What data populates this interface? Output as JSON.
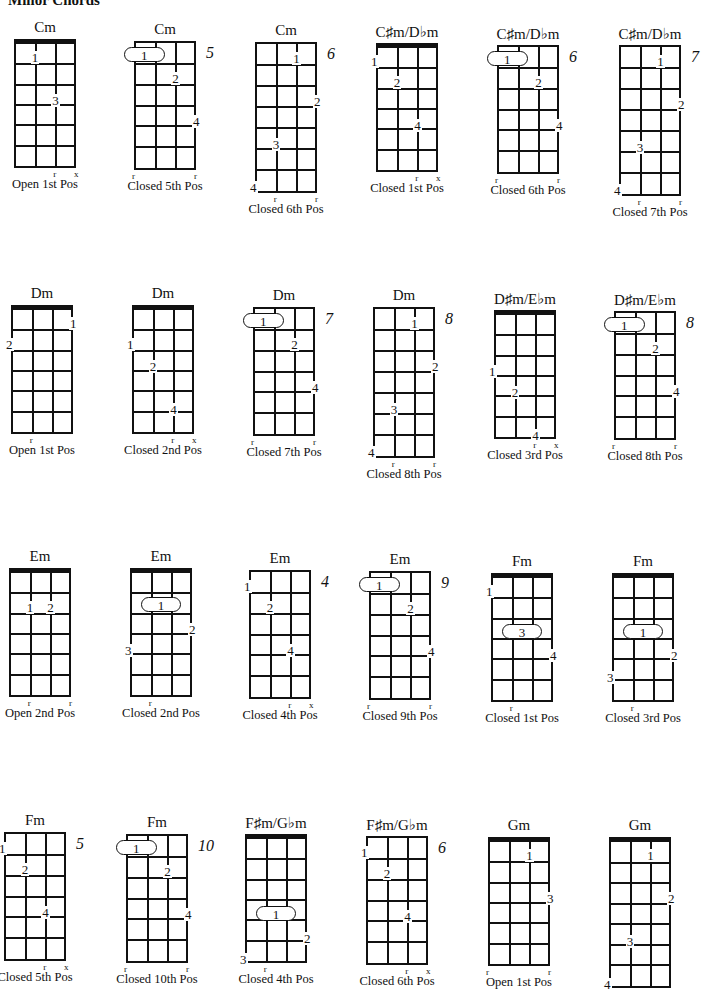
{
  "page": {
    "title": "Minor Chords"
  },
  "chords": [
    {
      "name": "Cm",
      "caption": "Open 1st Pos",
      "x": 14,
      "y": 39,
      "frets": 6,
      "nut": true,
      "pos": "",
      "fingers": [
        {
          "s": 1,
          "f": 1,
          "n": "1"
        },
        {
          "s": 2,
          "f": 3,
          "n": "3"
        }
      ],
      "barre": null,
      "bottom": [
        {
          "s": 2,
          "m": "r"
        },
        {
          "s": 3,
          "m": "x"
        }
      ]
    },
    {
      "name": "Cm",
      "caption": "Closed 5th Pos",
      "x": 134,
      "y": 41,
      "frets": 6,
      "nut": false,
      "pos": "5",
      "fingers": [
        {
          "s": 2,
          "f": 2,
          "n": "2"
        },
        {
          "s": 3,
          "f": 4,
          "n": "4"
        }
      ],
      "barre": {
        "from": 0,
        "to": 1,
        "f": 1,
        "n": "1"
      },
      "bottom": [
        {
          "s": 0,
          "m": "r"
        },
        {
          "s": 3,
          "m": "r"
        }
      ]
    },
    {
      "name": "Cm",
      "caption": "Closed 6th Pos",
      "x": 255,
      "y": 42,
      "frets": 7,
      "nut": false,
      "pos": "6",
      "fingers": [
        {
          "s": 2,
          "f": 1,
          "n": "1"
        },
        {
          "s": 3,
          "f": 3,
          "n": "2"
        },
        {
          "s": 1,
          "f": 5,
          "n": "3"
        },
        {
          "s": 0,
          "f": 7,
          "n": "4"
        }
      ],
      "barre": null,
      "bottom": [
        {
          "s": 1,
          "m": "r"
        },
        {
          "s": 3,
          "m": "r"
        }
      ]
    },
    {
      "name": "C♯m/D♭m",
      "caption": "Closed 1st Pos",
      "x": 376,
      "y": 43,
      "frets": 6,
      "nut": true,
      "pos": "",
      "fingers": [
        {
          "s": 0,
          "f": 1,
          "n": "1"
        },
        {
          "s": 1,
          "f": 2,
          "n": "2"
        },
        {
          "s": 2,
          "f": 4,
          "n": "4"
        }
      ],
      "barre": null,
      "bottom": [
        {
          "s": 2,
          "m": "r"
        },
        {
          "s": 3,
          "m": "x"
        }
      ]
    },
    {
      "name": "C♯m/D♭m",
      "caption": "Closed 6th Pos",
      "x": 497,
      "y": 45,
      "frets": 6,
      "nut": false,
      "pos": "6",
      "fingers": [
        {
          "s": 2,
          "f": 2,
          "n": "2"
        },
        {
          "s": 3,
          "f": 4,
          "n": "4"
        }
      ],
      "barre": {
        "from": 0,
        "to": 1,
        "f": 1,
        "n": "1"
      },
      "bottom": [
        {
          "s": 0,
          "m": "r"
        },
        {
          "s": 3,
          "m": "r"
        }
      ]
    },
    {
      "name": "C♯m/D♭m",
      "caption": "Closed 7th Pos",
      "x": 619,
      "y": 45,
      "frets": 7,
      "nut": false,
      "pos": "7",
      "fingers": [
        {
          "s": 2,
          "f": 1,
          "n": "1"
        },
        {
          "s": 3,
          "f": 3,
          "n": "2"
        },
        {
          "s": 1,
          "f": 5,
          "n": "3"
        },
        {
          "s": 0,
          "f": 7,
          "n": "4"
        }
      ],
      "barre": null,
      "bottom": [
        {
          "s": 1,
          "m": "r"
        },
        {
          "s": 3,
          "m": "r"
        }
      ]
    },
    {
      "name": "Dm",
      "caption": "Open 1st Pos",
      "x": 11,
      "y": 305,
      "frets": 6,
      "nut": true,
      "pos": "",
      "fingers": [
        {
          "s": 3,
          "f": 1,
          "n": "1"
        },
        {
          "s": 0,
          "f": 2,
          "n": "2"
        }
      ],
      "barre": null,
      "bottom": [
        {
          "s": 1,
          "m": "r"
        }
      ]
    },
    {
      "name": "Dm",
      "caption": "Closed 2nd Pos",
      "x": 132,
      "y": 305,
      "frets": 6,
      "nut": true,
      "pos": "",
      "fingers": [
        {
          "s": 0,
          "f": 2,
          "n": "1"
        },
        {
          "s": 1,
          "f": 3,
          "n": "2"
        },
        {
          "s": 2,
          "f": 5,
          "n": "4"
        }
      ],
      "barre": null,
      "bottom": [
        {
          "s": 2,
          "m": "r"
        },
        {
          "s": 3,
          "m": "x"
        }
      ]
    },
    {
      "name": "Dm",
      "caption": "Closed 7th Pos",
      "x": 253,
      "y": 307,
      "frets": 6,
      "nut": false,
      "pos": "7",
      "fingers": [
        {
          "s": 2,
          "f": 2,
          "n": "2"
        },
        {
          "s": 3,
          "f": 4,
          "n": "4"
        }
      ],
      "barre": {
        "from": 0,
        "to": 1,
        "f": 1,
        "n": "1"
      },
      "bottom": [
        {
          "s": 0,
          "m": "r"
        },
        {
          "s": 3,
          "m": "r"
        }
      ]
    },
    {
      "name": "Dm",
      "caption": "Closed 8th Pos",
      "x": 373,
      "y": 307,
      "frets": 7,
      "nut": false,
      "pos": "8",
      "fingers": [
        {
          "s": 2,
          "f": 1,
          "n": "1"
        },
        {
          "s": 3,
          "f": 3,
          "n": "2"
        },
        {
          "s": 1,
          "f": 5,
          "n": "3"
        },
        {
          "s": 0,
          "f": 7,
          "n": "4"
        }
      ],
      "barre": null,
      "bottom": [
        {
          "s": 1,
          "m": "r"
        },
        {
          "s": 3,
          "m": "r"
        }
      ]
    },
    {
      "name": "D♯m/E♭m",
      "caption": "Closed 3rd Pos",
      "x": 494,
      "y": 310,
      "frets": 6,
      "nut": true,
      "pos": "",
      "fingers": [
        {
          "s": 0,
          "f": 3,
          "n": "1"
        },
        {
          "s": 1,
          "f": 4,
          "n": "2"
        },
        {
          "s": 2,
          "f": 6,
          "n": "4"
        }
      ],
      "barre": null,
      "bottom": [
        {
          "s": 2,
          "m": "r"
        },
        {
          "s": 3,
          "m": "x"
        }
      ]
    },
    {
      "name": "D♯m/E♭m",
      "caption": "Closed 8th Pos",
      "x": 614,
      "y": 311,
      "frets": 6,
      "nut": false,
      "pos": "8",
      "fingers": [
        {
          "s": 2,
          "f": 2,
          "n": "2"
        },
        {
          "s": 3,
          "f": 4,
          "n": "4"
        }
      ],
      "barre": {
        "from": 0,
        "to": 1,
        "f": 1,
        "n": "1"
      },
      "bottom": [
        {
          "s": 0,
          "m": "r"
        },
        {
          "s": 3,
          "m": "r"
        }
      ]
    },
    {
      "name": "Em",
      "caption": "Open 2nd Pos",
      "x": 9,
      "y": 568,
      "frets": 6,
      "nut": true,
      "pos": "",
      "fingers": [
        {
          "s": 1,
          "f": 2,
          "n": "1"
        },
        {
          "s": 2,
          "f": 2,
          "n": "2"
        }
      ],
      "barre": null,
      "bottom": [
        {
          "s": 1,
          "m": "r"
        },
        {
          "s": 3,
          "m": "r"
        }
      ]
    },
    {
      "name": "Em",
      "caption": "Closed 2nd Pos",
      "x": 130,
      "y": 568,
      "frets": 6,
      "nut": true,
      "pos": "",
      "fingers": [
        {
          "s": 3,
          "f": 3,
          "n": "2"
        },
        {
          "s": 0,
          "f": 4,
          "n": "3"
        }
      ],
      "barre": {
        "from": 1,
        "to": 2,
        "f": 2,
        "n": "1"
      },
      "bottom": [
        {
          "s": 1,
          "m": "r"
        }
      ]
    },
    {
      "name": "Em",
      "caption": "Closed 4th Pos",
      "x": 249,
      "y": 570,
      "frets": 6,
      "nut": false,
      "pos": "4",
      "fingers": [
        {
          "s": 0,
          "f": 1,
          "n": "1"
        },
        {
          "s": 1,
          "f": 2,
          "n": "2"
        },
        {
          "s": 2,
          "f": 4,
          "n": "4"
        }
      ],
      "barre": null,
      "bottom": [
        {
          "s": 2,
          "m": "r"
        },
        {
          "s": 3,
          "m": "x"
        }
      ]
    },
    {
      "name": "Em",
      "caption": "Closed 9th Pos",
      "x": 369,
      "y": 571,
      "frets": 6,
      "nut": false,
      "pos": "9",
      "fingers": [
        {
          "s": 2,
          "f": 2,
          "n": "2"
        },
        {
          "s": 3,
          "f": 4,
          "n": "4"
        }
      ],
      "barre": {
        "from": 0,
        "to": 1,
        "f": 1,
        "n": "1"
      },
      "bottom": [
        {
          "s": 0,
          "m": "r"
        },
        {
          "s": 3,
          "m": "r"
        }
      ]
    },
    {
      "name": "Fm",
      "caption": "Closed 1st Pos",
      "x": 491,
      "y": 573,
      "frets": 6,
      "nut": true,
      "pos": "",
      "fingers": [
        {
          "s": 0,
          "f": 1,
          "n": "1"
        },
        {
          "s": 3,
          "f": 4,
          "n": "4"
        }
      ],
      "barre": {
        "from": 1,
        "to": 2,
        "f": 3,
        "n": "3"
      },
      "bottom": [
        {
          "s": 1,
          "m": "r"
        }
      ]
    },
    {
      "name": "Fm",
      "caption": "Closed 3rd Pos",
      "x": 612,
      "y": 573,
      "frets": 6,
      "nut": true,
      "pos": "",
      "fingers": [
        {
          "s": 3,
          "f": 4,
          "n": "2"
        },
        {
          "s": 0,
          "f": 5,
          "n": "3"
        }
      ],
      "barre": {
        "from": 1,
        "to": 2,
        "f": 3,
        "n": "1"
      },
      "bottom": [
        {
          "s": 1,
          "m": "r"
        }
      ]
    },
    {
      "name": "Fm",
      "caption": "Closed 5th Pos",
      "x": 4,
      "y": 832,
      "frets": 6,
      "nut": false,
      "pos": "5",
      "fingers": [
        {
          "s": 0,
          "f": 1,
          "n": "1"
        },
        {
          "s": 1,
          "f": 2,
          "n": "2"
        },
        {
          "s": 2,
          "f": 4,
          "n": "4"
        }
      ],
      "barre": null,
      "bottom": [
        {
          "s": 2,
          "m": "r"
        },
        {
          "s": 3,
          "m": "x"
        }
      ]
    },
    {
      "name": "Fm",
      "caption": "Closed 10th Pos",
      "x": 126,
      "y": 834,
      "frets": 6,
      "nut": false,
      "pos": "10",
      "fingers": [
        {
          "s": 2,
          "f": 2,
          "n": "2"
        },
        {
          "s": 3,
          "f": 4,
          "n": "4"
        }
      ],
      "barre": {
        "from": 0,
        "to": 1,
        "f": 1,
        "n": "1"
      },
      "bottom": [
        {
          "s": 0,
          "m": "r"
        },
        {
          "s": 3,
          "m": "r"
        }
      ]
    },
    {
      "name": "F♯m/G♭m",
      "caption": "Closed 4th Pos",
      "x": 245,
      "y": 834,
      "frets": 6,
      "nut": true,
      "pos": "",
      "fingers": [
        {
          "s": 3,
          "f": 5,
          "n": "2"
        },
        {
          "s": 0,
          "f": 6,
          "n": "3"
        }
      ],
      "barre": {
        "from": 1,
        "to": 2,
        "f": 4,
        "n": "1"
      },
      "bottom": [
        {
          "s": 1,
          "m": "r"
        }
      ]
    },
    {
      "name": "F♯m/G♭m",
      "caption": "Closed 6th Pos",
      "x": 366,
      "y": 836,
      "frets": 6,
      "nut": false,
      "pos": "6",
      "fingers": [
        {
          "s": 0,
          "f": 1,
          "n": "1"
        },
        {
          "s": 1,
          "f": 2,
          "n": "2"
        },
        {
          "s": 2,
          "f": 4,
          "n": "4"
        }
      ],
      "barre": null,
      "bottom": [
        {
          "s": 2,
          "m": "r"
        },
        {
          "s": 3,
          "m": "x"
        }
      ]
    },
    {
      "name": "Gm",
      "caption": "Open 1st Pos",
      "x": 488,
      "y": 837,
      "frets": 6,
      "nut": true,
      "pos": "",
      "fingers": [
        {
          "s": 2,
          "f": 1,
          "n": "1"
        },
        {
          "s": 3,
          "f": 3,
          "n": "3"
        }
      ],
      "barre": null,
      "bottom": [
        {
          "s": 0,
          "m": "r"
        },
        {
          "s": 3,
          "m": "r"
        }
      ]
    },
    {
      "name": "Gm",
      "caption": "",
      "x": 609,
      "y": 837,
      "frets": 7,
      "nut": true,
      "pos": "",
      "fingers": [
        {
          "s": 2,
          "f": 1,
          "n": "1"
        },
        {
          "s": 3,
          "f": 3,
          "n": "2"
        },
        {
          "s": 1,
          "f": 5,
          "n": "3"
        },
        {
          "s": 0,
          "f": 7,
          "n": "4"
        }
      ],
      "barre": null,
      "bottom": []
    }
  ]
}
